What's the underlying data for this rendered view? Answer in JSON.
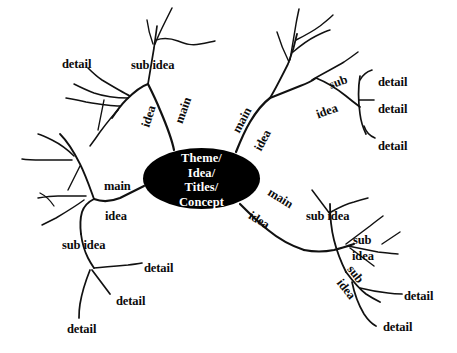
{
  "diagram": {
    "type": "mind-map",
    "title_node": "Theme/\nIdea/\nTitles/\nConcept",
    "background_color": "#ffffff",
    "node_fill_color": "#000000",
    "node_text_color": "#ffffff",
    "stroke_color": "#111111",
    "branch_count": 4,
    "labels": [
      {
        "id": "ul-detail",
        "text": "detail",
        "x": 62,
        "y": 58,
        "size": 12.5,
        "rot": 0
      },
      {
        "id": "ul-sub-idea",
        "text": "sub idea",
        "x": 131,
        "y": 59,
        "size": 12.5,
        "rot": 0
      },
      {
        "id": "ul-idea",
        "text": "idea",
        "x": 138,
        "y": 110,
        "size": 12.5,
        "rot": -72
      },
      {
        "id": "ul-main",
        "text": "main",
        "x": 170,
        "y": 104,
        "size": 12.5,
        "rot": -70
      },
      {
        "id": "ur-main",
        "text": "main",
        "x": 229,
        "y": 114,
        "size": 12.5,
        "rot": -62
      },
      {
        "id": "ur-idea",
        "text": "idea",
        "x": 252,
        "y": 134,
        "size": 12.5,
        "rot": -62
      },
      {
        "id": "ur-sub",
        "text": "sub",
        "x": 329,
        "y": 76,
        "size": 12.5,
        "rot": -20
      },
      {
        "id": "ur-idea2",
        "text": "idea",
        "x": 316,
        "y": 105,
        "size": 12.5,
        "rot": -20
      },
      {
        "id": "ur-detail-1",
        "text": "detail",
        "x": 378,
        "y": 76,
        "size": 12.5,
        "rot": 0
      },
      {
        "id": "ur-detail-2",
        "text": "detail",
        "x": 378,
        "y": 103,
        "size": 12.5,
        "rot": 0
      },
      {
        "id": "ur-detail-3",
        "text": "detail",
        "x": 378,
        "y": 140,
        "size": 12.5,
        "rot": 0
      },
      {
        "id": "ll-main",
        "text": "main",
        "x": 104,
        "y": 180,
        "size": 12.5,
        "rot": 0
      },
      {
        "id": "ll-idea",
        "text": "idea",
        "x": 105,
        "y": 210,
        "size": 12.5,
        "rot": 0
      },
      {
        "id": "ll-sub-idea",
        "text": "sub idea",
        "x": 62,
        "y": 239,
        "size": 12.5,
        "rot": 0
      },
      {
        "id": "ll-detail-1",
        "text": "detail",
        "x": 144,
        "y": 262,
        "size": 12.5,
        "rot": 0
      },
      {
        "id": "ll-detail-2",
        "text": "detail",
        "x": 116,
        "y": 295,
        "size": 12.5,
        "rot": 0
      },
      {
        "id": "ll-detail-3",
        "text": "detail",
        "x": 67,
        "y": 323,
        "size": 12.5,
        "rot": 0
      },
      {
        "id": "lr-main",
        "text": "main",
        "x": 267,
        "y": 192,
        "size": 12.5,
        "rot": 32
      },
      {
        "id": "lr-idea",
        "text": "idea",
        "x": 248,
        "y": 214,
        "size": 12.5,
        "rot": 32
      },
      {
        "id": "lr-sub-idea",
        "text": "sub idea",
        "x": 306,
        "y": 210,
        "size": 12.5,
        "rot": 0
      },
      {
        "id": "lr-sub",
        "text": "sub",
        "x": 353,
        "y": 234,
        "size": 12.5,
        "rot": 0
      },
      {
        "id": "lr-idea2",
        "text": "idea",
        "x": 352,
        "y": 250,
        "size": 12.5,
        "rot": 0
      },
      {
        "id": "lr-sub-rot",
        "text": "sub",
        "x": 346,
        "y": 268,
        "size": 12.5,
        "rot": 52
      },
      {
        "id": "lr-idea-rot",
        "text": "idea",
        "x": 335,
        "y": 283,
        "size": 12.5,
        "rot": 52
      },
      {
        "id": "lr-detail-1",
        "text": "detail",
        "x": 404,
        "y": 290,
        "size": 12.5,
        "rot": 0
      },
      {
        "id": "lr-detail-2",
        "text": "detail",
        "x": 383,
        "y": 321,
        "size": 12.5,
        "rot": 0
      }
    ]
  }
}
